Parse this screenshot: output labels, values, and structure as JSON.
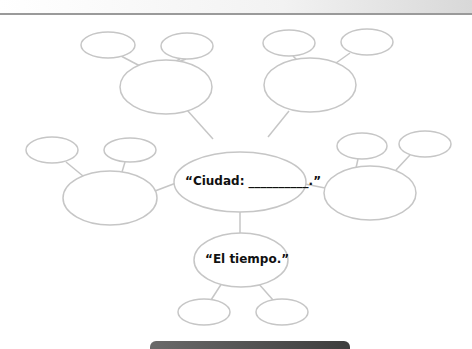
{
  "diagram": {
    "type": "mind-map",
    "center": {
      "label": "“Ciudad: __________.”"
    },
    "branches": [
      {
        "id": "top-left",
        "label": "",
        "children": [
          "",
          ""
        ]
      },
      {
        "id": "top-right",
        "label": "",
        "children": [
          "",
          ""
        ]
      },
      {
        "id": "left",
        "label": "",
        "children": [
          "",
          ""
        ]
      },
      {
        "id": "right",
        "label": "",
        "children": [
          "",
          ""
        ]
      },
      {
        "id": "bottom",
        "label": "“El tiempo.”",
        "children": [
          "",
          ""
        ]
      }
    ],
    "colors": {
      "stroke": "#c8c8c8",
      "text": "#111111"
    }
  }
}
